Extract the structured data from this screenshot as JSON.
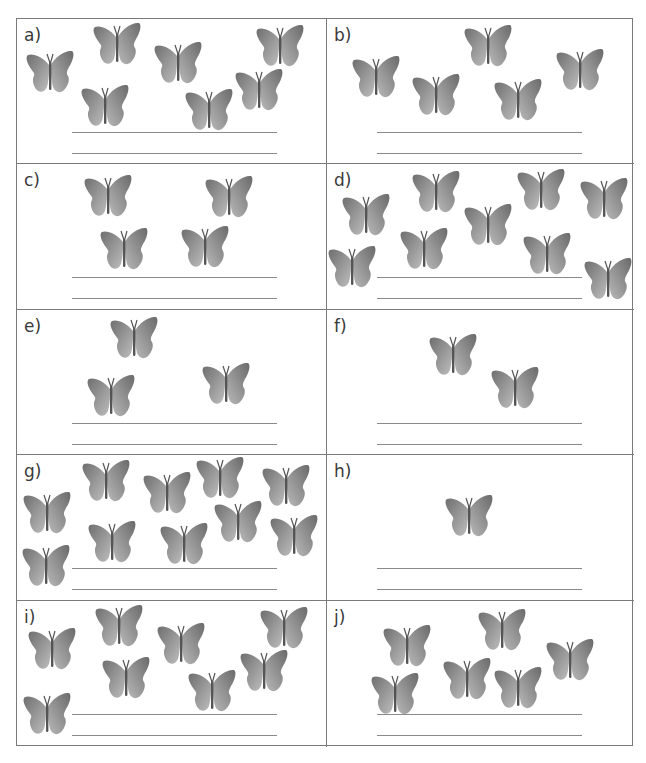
{
  "worksheet": {
    "cells": [
      {
        "label": "a)",
        "count": 7,
        "butterflies": [
          [
            8,
            30
          ],
          [
            75,
            2
          ],
          [
            136,
            21
          ],
          [
            238,
            4
          ],
          [
            63,
            64
          ],
          [
            167,
            68
          ],
          [
            217,
            48
          ]
        ]
      },
      {
        "label": "b)",
        "count": 5,
        "butterflies": [
          [
            24,
            35
          ],
          [
            84,
            53
          ],
          [
            136,
            4
          ],
          [
            166,
            58
          ],
          [
            228,
            28
          ]
        ]
      },
      {
        "label": "c)",
        "count": 4,
        "butterflies": [
          [
            66,
            9
          ],
          [
            187,
            10
          ],
          [
            82,
            62
          ],
          [
            163,
            60
          ]
        ]
      },
      {
        "label": "d)",
        "count": 10,
        "butterflies": [
          [
            14,
            28
          ],
          [
            84,
            5
          ],
          [
            136,
            38
          ],
          [
            189,
            3
          ],
          [
            252,
            12
          ],
          [
            0,
            80
          ],
          [
            72,
            62
          ],
          [
            195,
            67
          ],
          [
            256,
            92
          ]
        ]
      },
      {
        "label": "e)",
        "count": 3,
        "butterflies": [
          [
            92,
            5
          ],
          [
            69,
            63
          ],
          [
            184,
            51
          ]
        ]
      },
      {
        "label": "f)",
        "count": 2,
        "butterflies": [
          [
            101,
            22
          ],
          [
            163,
            55
          ]
        ]
      },
      {
        "label": "g)",
        "count": 10,
        "butterflies": [
          [
            5,
            35
          ],
          [
            64,
            3
          ],
          [
            125,
            15
          ],
          [
            178,
            0
          ],
          [
            244,
            8
          ],
          [
            70,
            64
          ],
          [
            142,
            66
          ],
          [
            196,
            44
          ],
          [
            252,
            58
          ],
          [
            4,
            88
          ]
        ]
      },
      {
        "label": "h)",
        "count": 1,
        "butterflies": [
          [
            117,
            38
          ]
        ]
      },
      {
        "label": "i)",
        "count": 9,
        "butterflies": [
          [
            10,
            25
          ],
          [
            77,
            2
          ],
          [
            139,
            20
          ],
          [
            242,
            4
          ],
          [
            84,
            54
          ],
          [
            170,
            67
          ],
          [
            222,
            47
          ],
          [
            5,
            90
          ]
        ]
      },
      {
        "label": "j)",
        "count": 7,
        "butterflies": [
          [
            55,
            22
          ],
          [
            150,
            6
          ],
          [
            218,
            36
          ],
          [
            43,
            70
          ],
          [
            115,
            55
          ],
          [
            166,
            64
          ]
        ]
      }
    ]
  },
  "colors": {
    "butterfly_light": "#b4b4b4",
    "butterfly_dark": "#6e6e6e",
    "grid_line": "#7a7a7a",
    "answer_line": "#8a8a8a"
  }
}
